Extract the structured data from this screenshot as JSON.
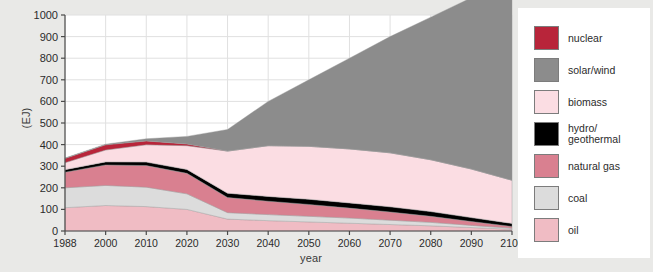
{
  "chart_data": {
    "type": "area",
    "stacked": true,
    "title": "",
    "xlabel": "year",
    "ylabel": "(EJ)",
    "xlim": [
      1988,
      2100
    ],
    "ylim": [
      0,
      1000
    ],
    "grid": true,
    "legend_position": "right",
    "x": [
      1988,
      2000,
      2010,
      2020,
      2030,
      2040,
      2050,
      2060,
      2070,
      2080,
      2090,
      2100
    ],
    "xtick_labels": [
      "1988",
      "2000",
      "2010",
      "2020",
      "2030",
      "2040",
      "2050",
      "2060",
      "2070",
      "2080",
      "2090",
      "2100"
    ],
    "ytick_labels": [
      "0",
      "100",
      "200",
      "300",
      "400",
      "500",
      "600",
      "700",
      "800",
      "900",
      "1000"
    ],
    "ytick_values": [
      0,
      100,
      200,
      300,
      400,
      500,
      600,
      700,
      800,
      900,
      1000
    ],
    "stack_order_bottom_to_top": [
      "oil",
      "coal",
      "natural gas",
      "hydro/geothermal",
      "biomass",
      "nuclear",
      "solar/wind"
    ],
    "series": [
      {
        "name": "oil",
        "color": "#f0bcc4",
        "values": [
          108,
          118,
          113,
          100,
          55,
          48,
          42,
          36,
          30,
          24,
          16,
          8
        ]
      },
      {
        "name": "coal",
        "color": "#dcdcdc",
        "values": [
          92,
          93,
          90,
          72,
          30,
          28,
          26,
          24,
          20,
          16,
          10,
          5
        ]
      },
      {
        "name": "natural gas",
        "color": "#d98090",
        "values": [
          72,
          95,
          100,
          95,
          70,
          62,
          55,
          46,
          38,
          28,
          18,
          8
        ]
      },
      {
        "name": "hydro/geothermal",
        "color": "#000000",
        "values": [
          12,
          14,
          16,
          18,
          20,
          22,
          24,
          24,
          24,
          22,
          18,
          14
        ]
      },
      {
        "name": "biomass",
        "color": "#fbdde3",
        "values": [
          32,
          55,
          80,
          110,
          195,
          235,
          245,
          250,
          250,
          240,
          225,
          200
        ]
      },
      {
        "name": "nuclear",
        "color": "#b8253a",
        "values": [
          20,
          24,
          18,
          8,
          0,
          0,
          0,
          0,
          0,
          0,
          0,
          0
        ]
      },
      {
        "name": "solar/wind",
        "color": "#8c8c8c",
        "values": [
          2,
          3,
          10,
          35,
          100,
          205,
          308,
          420,
          538,
          660,
          793,
          965
        ]
      }
    ],
    "totals": [
      338,
      402,
      427,
      438,
      470,
      600,
      700,
      800,
      900,
      990,
      1080,
      1200
    ]
  },
  "legend": {
    "items": [
      {
        "label": "nuclear",
        "color": "#b8253a"
      },
      {
        "label": "solar/wind",
        "color": "#8c8c8c"
      },
      {
        "label": "biomass",
        "color": "#fbdde3"
      },
      {
        "label": "hydro/\ngeothermal",
        "color": "#000000"
      },
      {
        "label": "natural gas",
        "color": "#d98090"
      },
      {
        "label": "coal",
        "color": "#dcdcdc"
      },
      {
        "label": "oil",
        "color": "#f0bcc4"
      }
    ]
  },
  "colors": {
    "page_background": "#e9e9e7",
    "plot_background": "#ffffff",
    "gridline": "#e0e0e0",
    "axis": "#4a4a4a",
    "text": "#2b2b2b"
  }
}
